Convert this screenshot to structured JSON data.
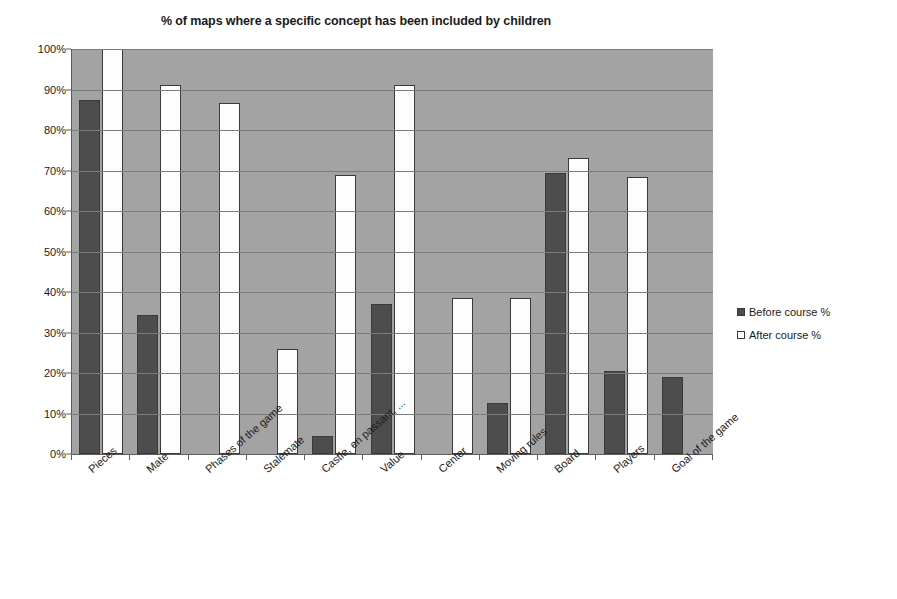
{
  "chart_data": {
    "type": "bar",
    "title": "% of maps where a specific concept has been included by children",
    "xlabel": "",
    "ylabel": "",
    "ylim": [
      0,
      100
    ],
    "ytick_labels": [
      "0%",
      "10%",
      "20%",
      "30%",
      "40%",
      "50%",
      "60%",
      "70%",
      "80%",
      "90%",
      "100%"
    ],
    "ytick_values": [
      0,
      10,
      20,
      30,
      40,
      50,
      60,
      70,
      80,
      90,
      100
    ],
    "grid": true,
    "legend_position": "right",
    "categories": [
      "Pieces",
      "Mate",
      "Phases of the game",
      "Stalemate",
      "Castle, en passant, ...",
      "Value",
      "Center",
      "Moving rules",
      "Board",
      "Players",
      "Goal of the game"
    ],
    "series": [
      {
        "name": "Before course %",
        "color": "#4d4d4d",
        "values": [
          87.4,
          34.3,
          0,
          0,
          4.4,
          37.0,
          0,
          12.5,
          69.5,
          20.6,
          19.0
        ]
      },
      {
        "name": "After course %",
        "color": "#ffffff",
        "values": [
          100.0,
          91.2,
          86.7,
          26.0,
          69.0,
          91.2,
          38.5,
          38.5,
          73.2,
          68.5,
          0
        ]
      }
    ]
  },
  "legend": {
    "items": [
      {
        "label": "Before course %",
        "style": "before"
      },
      {
        "label": "After course %",
        "style": "after"
      }
    ]
  },
  "colors": {
    "plot_background": "#a3a3a3",
    "gridline": "#7c7c7c",
    "axis": "#5d5d5d",
    "before_bar": "#4d4d4d",
    "after_bar": "#fdfdfd",
    "text": "#1b1b1b",
    "page_background": "#ffffff"
  }
}
